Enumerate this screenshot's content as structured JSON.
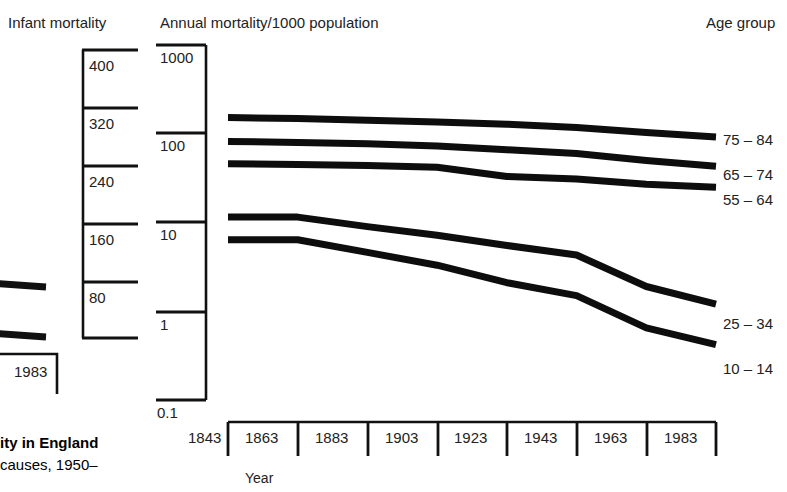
{
  "figure": {
    "left_panel_header": "Infant mortality",
    "main_header": "Annual mortality/1000 population",
    "right_header": "Age group",
    "xaxis_label": "Year",
    "cropped_year_label": "1983",
    "caption_line1": "ity in England",
    "caption_line2": "causes, 1950–"
  },
  "infant_mortality_axis": {
    "ticks": [
      "400",
      "320",
      "240",
      "160",
      "80"
    ]
  },
  "chart_data": {
    "type": "line",
    "title": "Annual mortality/1000 population",
    "xlabel": "Year",
    "ylabel": "Annual mortality/1000 population",
    "yscale": "log",
    "ylim": [
      0.1,
      1000
    ],
    "ytick_labels": [
      "1000",
      "100",
      "10",
      "1",
      "0.1"
    ],
    "ytick_values": [
      1000,
      100,
      10,
      1,
      0.1
    ],
    "xtick_labels": [
      "1843",
      "1863",
      "1883",
      "1903",
      "1923",
      "1943",
      "1963",
      "1983"
    ],
    "xtick_values": [
      1843,
      1863,
      1883,
      1903,
      1923,
      1943,
      1963,
      1983
    ],
    "xlim": [
      1843,
      1983
    ],
    "grid": false,
    "legend_position": "right",
    "x": [
      1843,
      1863,
      1883,
      1903,
      1923,
      1943,
      1963,
      1983
    ],
    "series": [
      {
        "name": "75 – 84",
        "values": [
          152,
          148,
          142,
          136,
          128,
          118,
          103,
          92
        ]
      },
      {
        "name": "65 – 74",
        "values": [
          82,
          80,
          77,
          73,
          66,
          60,
          50,
          43
        ]
      },
      {
        "name": "55 – 64",
        "values": [
          46,
          45,
          44,
          42,
          33,
          31,
          27,
          25
        ]
      },
      {
        "name": "25 – 34",
        "values": [
          11.5,
          11.5,
          9.0,
          7.2,
          5.5,
          4.3,
          1.9,
          1.2
        ]
      },
      {
        "name": "10 – 14",
        "values": [
          6.4,
          6.4,
          4.6,
          3.3,
          2.1,
          1.5,
          0.65,
          0.42
        ]
      }
    ]
  },
  "cropped_left_chart": {
    "year_tick": "1983"
  }
}
